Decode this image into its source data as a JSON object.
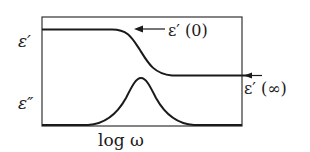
{
  "diagram": {
    "type": "dielectric-relaxation-plot",
    "x_axis_label": "log ω",
    "curves": [
      {
        "name": "real-permittivity",
        "label": "ε′",
        "shape": "sigmoid-decreasing"
      },
      {
        "name": "imaginary-permittivity",
        "label": "ε″",
        "shape": "peak"
      }
    ],
    "annotations": {
      "low_freq_limit": "ε′ (0)",
      "high_freq_limit": "ε′ (∞)"
    },
    "colors": {
      "line": "#1a1a1a",
      "frame": "#333333",
      "background": "#ffffff"
    }
  }
}
